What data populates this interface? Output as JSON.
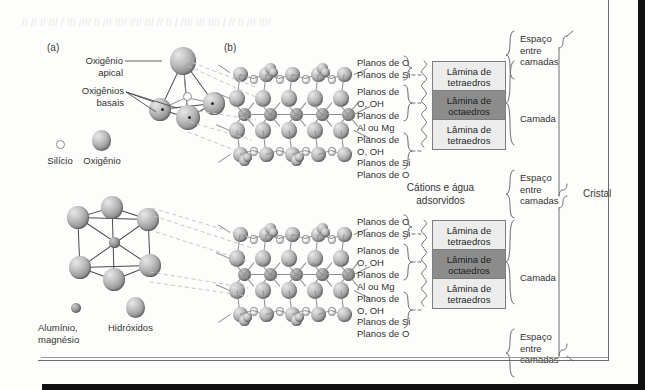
{
  "figure": {
    "panel_a_id": "(a)",
    "panel_b_id": "(b)"
  },
  "panel_a": {
    "apical_label": "Oxigênio\napical",
    "basal_label": "Oxigênios\nbasais",
    "legend": [
      {
        "name": "silicon",
        "label": "Silício"
      },
      {
        "name": "oxygen",
        "label": "Oxigênio"
      }
    ]
  },
  "panel_a_lower": {
    "legend": [
      {
        "name": "aluminium-magnesium",
        "label": "Alumínio,\nmagnésio"
      },
      {
        "name": "hydroxides",
        "label": "Hidróxidos"
      }
    ]
  },
  "planes_upper": [
    "Planos de O",
    "Planos de Si",
    "Planos de\nO, OH",
    "Planos de\nAl ou Mg",
    "Planos de\nO, OH",
    "Planos de Si",
    "Planos de O"
  ],
  "planes_lower": [
    "Planos de O",
    "Planos de Si",
    "Planos de\nO, OH",
    "Planos de\nAl ou Mg",
    "Planos de\nO, OH",
    "Planos de Si",
    "Planos de O"
  ],
  "sheets_upper": [
    {
      "name": "tetrahedral-sheet",
      "label": "Lâmina de\ntetraedros",
      "kind": "tet"
    },
    {
      "name": "octahedral-sheet",
      "label": "Lâmina de\noctaedros",
      "kind": "oct"
    },
    {
      "name": "tetrahedral-sheet",
      "label": "Lâmina de\ntetraedros",
      "kind": "tet"
    }
  ],
  "sheets_lower": [
    {
      "name": "tetrahedral-sheet",
      "label": "Lâmina de\ntetraedros",
      "kind": "tet"
    },
    {
      "name": "octahedral-sheet",
      "label": "Lâmina de\noctaedros",
      "kind": "oct"
    },
    {
      "name": "tetrahedral-sheet",
      "label": "Lâmina de\ntetraedros",
      "kind": "tet"
    }
  ],
  "interlayer": {
    "cations_water": "Cátions e água\nadsorvidos"
  },
  "right_labels": {
    "interlayer_top": "Espaço\nentre\ncamadas",
    "layer_top": "Camada",
    "interlayer_mid": "Espaço\nentre\ncamadas",
    "layer_bottom": "Camada",
    "interlayer_bottom": "Espaço\nentre\ncamadas",
    "crystal": "Cristal"
  },
  "colors": {
    "tetrahedral_fill": "#ececec",
    "octahedral_fill": "#8c8c8c",
    "box_border": "#7d7d7d",
    "text": "#2b2b2b",
    "leader": "#bdbdbd",
    "page": "#fdfdfc"
  },
  "ghost": "// // // /// / /// //// // /// //// //// /// // // / //// /// //// / // // /// ////"
}
